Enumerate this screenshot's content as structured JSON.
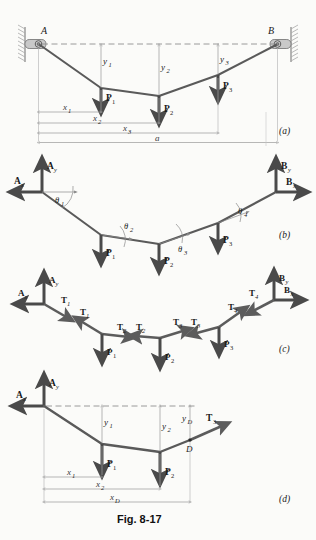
{
  "figure": {
    "caption": "Fig. 8-17",
    "panel_tags": [
      "(a)",
      "(b)",
      "(c)",
      "(d)"
    ]
  },
  "colors": {
    "cable": "#5a5a5a",
    "arrow": "#4a4a4a",
    "dashed_reference": "#8e8e8e",
    "dimension": "#9a9a9a",
    "background": "#fbfbf9"
  },
  "panel_a": {
    "tag": "(a)",
    "supports": [
      {
        "name": "A",
        "label": "A",
        "side": "left"
      },
      {
        "name": "B",
        "label": "B",
        "side": "right"
      }
    ],
    "loads": [
      {
        "label": "P",
        "sub": "1"
      },
      {
        "label": "P",
        "sub": "2"
      },
      {
        "label": "P",
        "sub": "3"
      }
    ],
    "sags": [
      {
        "label": "y",
        "sub": "1"
      },
      {
        "label": "y",
        "sub": "2"
      },
      {
        "label": "y",
        "sub": "3"
      }
    ],
    "distances": [
      {
        "label": "x",
        "sub": "1"
      },
      {
        "label": "x",
        "sub": "2"
      },
      {
        "label": "x",
        "sub": "3"
      },
      {
        "label": "a",
        "sub": ""
      }
    ]
  },
  "panel_b": {
    "tag": "(b)",
    "reactions": [
      {
        "label": "A",
        "sub": "x"
      },
      {
        "label": "A",
        "sub": "y"
      },
      {
        "label": "B",
        "sub": "x"
      },
      {
        "label": "B",
        "sub": "y"
      }
    ],
    "angles": [
      {
        "label": "θ",
        "sub": "1"
      },
      {
        "label": "θ",
        "sub": "2"
      },
      {
        "label": "θ",
        "sub": "3"
      },
      {
        "label": "θ",
        "sub": "4"
      }
    ],
    "loads": [
      {
        "label": "P",
        "sub": "1"
      },
      {
        "label": "P",
        "sub": "2"
      },
      {
        "label": "P",
        "sub": "3"
      }
    ]
  },
  "panel_c": {
    "tag": "(c)",
    "reactions": [
      {
        "label": "A",
        "sub": "x"
      },
      {
        "label": "A",
        "sub": "y"
      },
      {
        "label": "B",
        "sub": "x"
      },
      {
        "label": "B",
        "sub": "y"
      }
    ],
    "tensions": [
      {
        "label": "T",
        "sub": "1"
      },
      {
        "label": "T",
        "sub": "1"
      },
      {
        "label": "T",
        "sub": "2"
      },
      {
        "label": "T",
        "sub": "2"
      },
      {
        "label": "T",
        "sub": "3"
      },
      {
        "label": "T",
        "sub": "3"
      },
      {
        "label": "T",
        "sub": "4"
      },
      {
        "label": "T",
        "sub": "4"
      }
    ],
    "loads": [
      {
        "label": "P",
        "sub": "1"
      },
      {
        "label": "P",
        "sub": "2"
      },
      {
        "label": "P",
        "sub": "3"
      }
    ]
  },
  "panel_d": {
    "tag": "(d)",
    "reactions": [
      {
        "label": "A",
        "sub": "x"
      },
      {
        "label": "A",
        "sub": "y"
      }
    ],
    "loads": [
      {
        "label": "P",
        "sub": "1"
      },
      {
        "label": "P",
        "sub": "2"
      }
    ],
    "tension": {
      "label": "T",
      "sub": "3"
    },
    "point_label": "D",
    "sags": [
      {
        "label": "y",
        "sub": "1"
      },
      {
        "label": "y",
        "sub": "2"
      },
      {
        "label": "y",
        "sub": "D"
      }
    ],
    "distances": [
      {
        "label": "x",
        "sub": "1"
      },
      {
        "label": "x",
        "sub": "2"
      },
      {
        "label": "x",
        "sub": "D"
      }
    ]
  }
}
